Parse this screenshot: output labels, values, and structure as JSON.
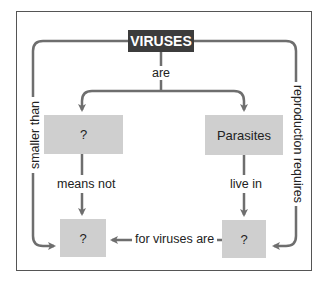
{
  "diagram": {
    "colors": {
      "line": "#6e6e6e",
      "box_fill": "#cfcfcf",
      "root_fill": "#3c3c3c",
      "root_text": "#ffffff",
      "frame": "#555555"
    },
    "nodes": {
      "root": "VIRUSES",
      "left_mid": "?",
      "right_mid": "Parasites",
      "bottom_left": "?",
      "bottom_right": "?"
    },
    "links": {
      "root_to_mid": "are",
      "left_mid_to_bottom_left": "means not",
      "right_mid_to_bottom_right": "live in",
      "bottom_right_to_bottom_left": "for viruses are",
      "root_to_bottom_left": "smaller than",
      "root_to_bottom_right": "reproduction requires"
    }
  }
}
